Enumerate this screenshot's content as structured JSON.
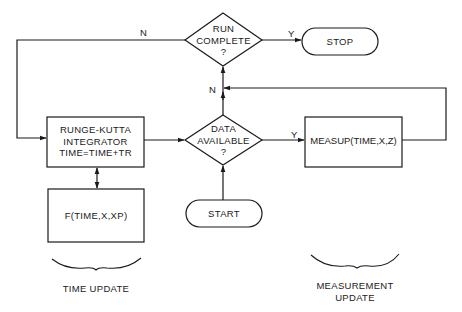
{
  "diagram": {
    "type": "flowchart",
    "nodes": {
      "run_complete": {
        "shape": "diamond",
        "lines": [
          "RUN",
          "COMPLETE",
          "?"
        ]
      },
      "stop": {
        "shape": "terminator",
        "label": "STOP"
      },
      "runge_kutta": {
        "shape": "process",
        "lines": [
          "RUNGE-KUTTA",
          "INTEGRATOR",
          "TIME=TIME+TR"
        ]
      },
      "data_available": {
        "shape": "diamond",
        "lines": [
          "DATA",
          "AVAILABLE",
          "?"
        ]
      },
      "measup": {
        "shape": "process",
        "label": "MEASUP(TIME,X,Z)"
      },
      "f_func": {
        "shape": "process",
        "label": "F(TIME,X,XP)"
      },
      "start": {
        "shape": "terminator",
        "label": "START"
      }
    },
    "edge_labels": {
      "run_complete_no": "N",
      "run_complete_yes": "Y",
      "data_available_no": "N",
      "data_available_yes": "Y"
    },
    "edges": [
      {
        "from": "start",
        "to": "data_available"
      },
      {
        "from": "data_available",
        "to": "measup",
        "label": "Y"
      },
      {
        "from": "data_available",
        "to": "run_complete",
        "label": "N"
      },
      {
        "from": "measup",
        "to": "run_complete"
      },
      {
        "from": "run_complete",
        "to": "stop",
        "label": "Y"
      },
      {
        "from": "run_complete",
        "to": "runge_kutta",
        "label": "N"
      },
      {
        "from": "runge_kutta",
        "to": "data_available"
      },
      {
        "from": "runge_kutta",
        "to": "f_func",
        "bidirectional": true
      }
    ],
    "group_labels": {
      "time_update": "TIME UPDATE",
      "measurement_update": [
        "MEASUREMENT",
        "UPDATE"
      ]
    },
    "colors": {
      "line": "#1a1a1a",
      "background": "#ffffff"
    }
  }
}
